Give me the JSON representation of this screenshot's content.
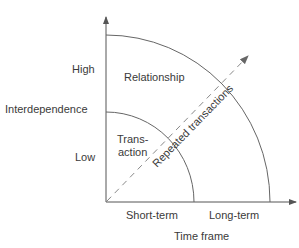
{
  "diagram": {
    "type": "quarter-circle relationship diagram",
    "y_axis": {
      "title": "Interdependence",
      "ticks": [
        "High",
        "Low"
      ]
    },
    "x_axis": {
      "title": "Time frame",
      "ticks": [
        "Short-term",
        "Long-term"
      ]
    },
    "regions": {
      "inner_line1": "Trans-",
      "inner_line2": "action",
      "outer": "Relationship"
    },
    "diagonal_label": "Repeated transactions",
    "colors": {
      "axis": "#555555",
      "arc": "#666666",
      "dashed": "#888888",
      "text": "#3a3a3a"
    }
  }
}
